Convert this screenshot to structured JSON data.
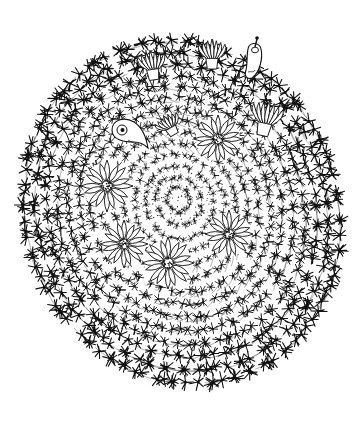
{
  "illustration": {
    "subject": "cactus-botanical-line-drawing",
    "width": 360,
    "height": 422,
    "background": "#ffffff",
    "ink": "#111111",
    "body": {
      "cx": 182,
      "cy": 212,
      "rx": 158,
      "ry": 176,
      "rotation": -22
    },
    "apex": {
      "x": 178,
      "y": 198
    },
    "spines": {
      "rings": 14,
      "per_ring_base": 10,
      "star_rays": 7,
      "ray_length_min": 3,
      "ray_length_max": 7.5,
      "seed": 7
    },
    "open_flowers": [
      {
        "id": "flower-top-center",
        "x": 218,
        "y": 139,
        "r": 24,
        "petals": 16
      },
      {
        "id": "flower-left",
        "x": 107,
        "y": 186,
        "r": 26,
        "petals": 16
      },
      {
        "id": "flower-lower-left",
        "x": 124,
        "y": 244,
        "r": 24,
        "petals": 16
      },
      {
        "id": "flower-bottom-center",
        "x": 168,
        "y": 263,
        "r": 26,
        "petals": 16
      },
      {
        "id": "flower-right",
        "x": 229,
        "y": 234,
        "r": 24,
        "petals": 16
      }
    ],
    "side_flowers": [
      {
        "id": "bud-top-left",
        "x": 152,
        "y": 65,
        "w": 26,
        "h": 30,
        "rot": -8
      },
      {
        "id": "bud-top-center",
        "x": 212,
        "y": 54,
        "w": 26,
        "h": 30,
        "rot": 0
      },
      {
        "id": "bud-right",
        "x": 266,
        "y": 118,
        "w": 30,
        "h": 36,
        "rot": 12
      },
      {
        "id": "bud-inner-left",
        "x": 169,
        "y": 125,
        "w": 24,
        "h": 22,
        "rot": -30
      }
    ],
    "fruits": [
      {
        "id": "fruit-curved-left",
        "x": 128,
        "y": 134,
        "kind": "curved"
      },
      {
        "id": "fruit-top-right",
        "x": 254,
        "y": 58,
        "kind": "elongated"
      }
    ]
  }
}
